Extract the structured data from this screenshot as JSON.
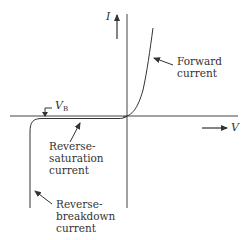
{
  "diagram": {
    "axes": {
      "y_label": "I",
      "x_label": "V"
    },
    "labels": {
      "breakdown_voltage": "V",
      "breakdown_voltage_sub": "B",
      "forward_line1": "Forward",
      "forward_line2": "current",
      "rev_sat_line1": "Reverse-",
      "rev_sat_line2": "saturation",
      "rev_sat_line3": "current",
      "rev_bd_line1": "Reverse-",
      "rev_bd_line2": "breakdown",
      "rev_bd_line3": "current"
    },
    "colors": {
      "line": "#333333",
      "background": "#ffffff"
    }
  }
}
